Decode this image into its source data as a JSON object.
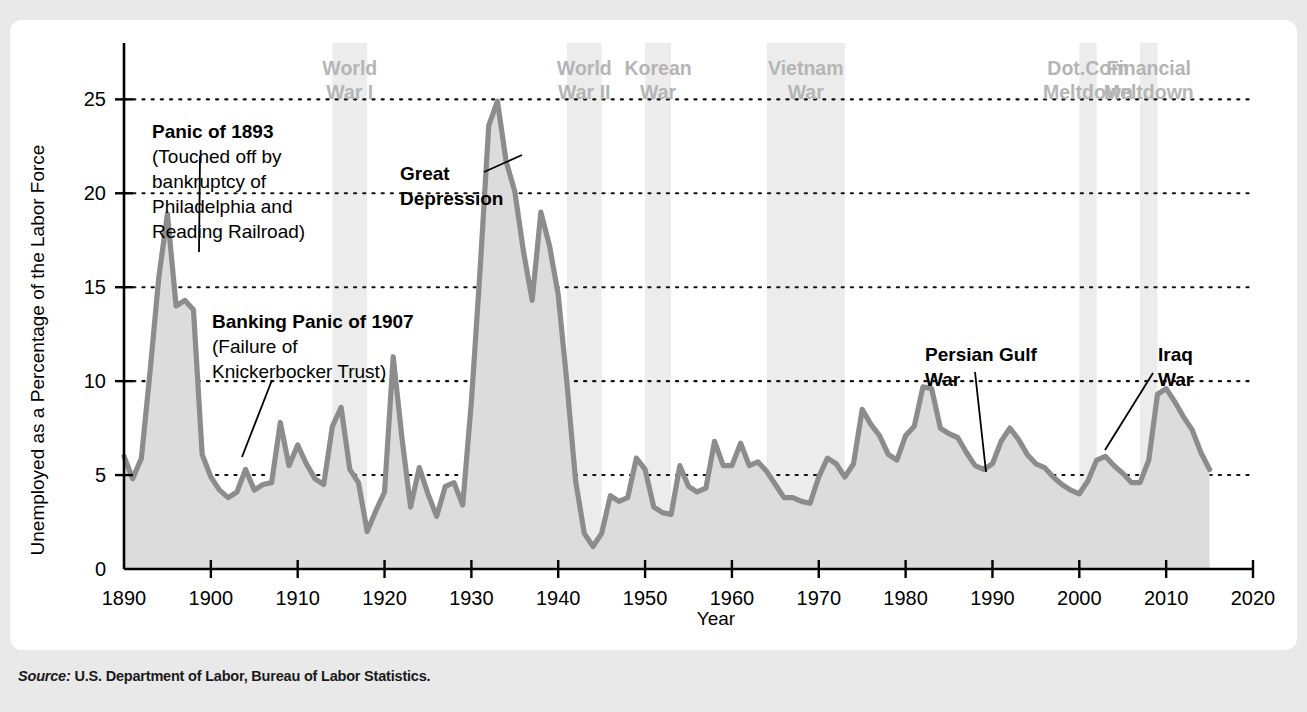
{
  "figure": {
    "source_prefix": "Source:",
    "source_text": "U.S. Department of Labor, Bureau of Labor Statistics."
  },
  "chart_data": {
    "type": "area",
    "title": "",
    "subtitle": "",
    "xlabel": "Year",
    "ylabel": "Unemployed as a Percentage of the Labor Force",
    "xlim": [
      1890,
      2020
    ],
    "ylim": [
      0,
      28
    ],
    "grid": "horizontal-dotted",
    "legend": "none",
    "x_ticks": [
      1890,
      1900,
      1910,
      1920,
      1930,
      1940,
      1950,
      1960,
      1970,
      1980,
      1990,
      2000,
      2010,
      2020
    ],
    "x_tick_labels": [
      "1890",
      "1900",
      "1910",
      "1920",
      "1930",
      "1940",
      "1950",
      "1960",
      "1970",
      "1980",
      "1990",
      "2000",
      "2010",
      "2020"
    ],
    "y_ticks": [
      0,
      5,
      10,
      15,
      20,
      25
    ],
    "y_tick_labels": [
      "0",
      "5",
      "10",
      "15",
      "20",
      "25"
    ],
    "line_color": "#8c8c8c",
    "fill_color": "#dcdcdc",
    "band_color": "#ececec",
    "x": [
      1890,
      1891,
      1892,
      1893,
      1894,
      1895,
      1896,
      1897,
      1898,
      1899,
      1900,
      1901,
      1902,
      1903,
      1904,
      1905,
      1906,
      1907,
      1908,
      1909,
      1910,
      1911,
      1912,
      1913,
      1914,
      1915,
      1916,
      1917,
      1918,
      1919,
      1920,
      1921,
      1922,
      1923,
      1924,
      1925,
      1926,
      1927,
      1928,
      1929,
      1930,
      1931,
      1932,
      1933,
      1934,
      1935,
      1936,
      1937,
      1938,
      1939,
      1940,
      1941,
      1942,
      1943,
      1944,
      1945,
      1946,
      1947,
      1948,
      1949,
      1950,
      1951,
      1952,
      1953,
      1954,
      1955,
      1956,
      1957,
      1958,
      1959,
      1960,
      1961,
      1962,
      1963,
      1964,
      1965,
      1966,
      1967,
      1968,
      1969,
      1970,
      1971,
      1972,
      1973,
      1974,
      1975,
      1976,
      1977,
      1978,
      1979,
      1980,
      1981,
      1982,
      1983,
      1984,
      1985,
      1986,
      1987,
      1988,
      1989,
      1990,
      1991,
      1992,
      1993,
      1994,
      1995,
      1996,
      1997,
      1998,
      1999,
      2000,
      2001,
      2002,
      2003,
      2004,
      2005,
      2006,
      2007,
      2008,
      2009,
      2010,
      2011,
      2012,
      2013,
      2014,
      2015
    ],
    "y": [
      6.0,
      4.8,
      5.9,
      10.5,
      15.5,
      18.9,
      14.0,
      14.3,
      13.8,
      6.1,
      4.9,
      4.2,
      3.8,
      4.1,
      5.3,
      4.2,
      4.5,
      4.6,
      7.8,
      5.5,
      6.6,
      5.6,
      4.8,
      4.5,
      7.6,
      8.6,
      5.3,
      4.6,
      2.0,
      3.1,
      4.1,
      11.3,
      7.0,
      3.3,
      5.4,
      4.0,
      2.8,
      4.4,
      4.6,
      3.4,
      8.9,
      15.9,
      23.6,
      24.9,
      21.7,
      20.1,
      16.9,
      14.3,
      19.0,
      17.2,
      14.6,
      9.9,
      4.7,
      1.9,
      1.2,
      1.9,
      3.9,
      3.6,
      3.8,
      5.9,
      5.3,
      3.3,
      3.0,
      2.9,
      5.5,
      4.4,
      4.1,
      4.3,
      6.8,
      5.5,
      5.5,
      6.7,
      5.5,
      5.7,
      5.2,
      4.5,
      3.8,
      3.8,
      3.6,
      3.5,
      4.9,
      5.9,
      5.6,
      4.9,
      5.6,
      8.5,
      7.7,
      7.1,
      6.1,
      5.8,
      7.1,
      7.6,
      9.7,
      9.6,
      7.5,
      7.2,
      7.0,
      6.2,
      5.5,
      5.3,
      5.6,
      6.8,
      7.5,
      6.9,
      6.1,
      5.6,
      5.4,
      4.9,
      4.5,
      4.2,
      4.0,
      4.7,
      5.8,
      6.0,
      5.5,
      5.1,
      4.6,
      4.6,
      5.8,
      9.3,
      9.6,
      8.9,
      8.1,
      7.4,
      6.2,
      5.3
    ]
  },
  "bands": [
    {
      "label_line1": "World",
      "label_line2": "War I",
      "start": 1914,
      "end": 1918
    },
    {
      "label_line1": "World",
      "label_line2": "War II",
      "start": 1941,
      "end": 1945
    },
    {
      "label_line1": "Korean",
      "label_line2": "War",
      "start": 1950,
      "end": 1953
    },
    {
      "label_line1": "Vietnam",
      "label_line2": "War",
      "start": 1964,
      "end": 1973
    },
    {
      "label_line1": "Dot.Com",
      "label_line2": "Meltdown",
      "start": 2000,
      "end": 2002
    },
    {
      "label_line1": "Financial",
      "label_line2": "Meltdown",
      "start": 2007,
      "end": 2009
    }
  ],
  "annotations": [
    {
      "id": "panic-1893",
      "bold_lines": [
        "Panic of 1893"
      ],
      "plain_lines": [
        "(Touched off by",
        "bankruptcy of",
        "Philadelphia and",
        "Reading Railroad)"
      ]
    },
    {
      "id": "banking-panic-1907",
      "bold_lines": [
        "Banking Panic of 1907"
      ],
      "plain_lines": [
        "(Failure of",
        "Knickerbocker Trust)"
      ]
    },
    {
      "id": "great-depression",
      "bold_lines": [
        "Great",
        "Depression"
      ],
      "plain_lines": []
    },
    {
      "id": "persian-gulf-war",
      "bold_lines": [
        "Persian Gulf",
        "War"
      ],
      "plain_lines": []
    },
    {
      "id": "iraq-war",
      "bold_lines": [
        "Iraq",
        "War"
      ],
      "plain_lines": []
    }
  ]
}
